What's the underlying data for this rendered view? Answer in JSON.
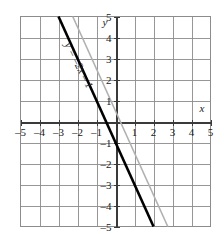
{
  "chart_data": {
    "type": "line",
    "title": "",
    "xlabel": "x",
    "ylabel": "y",
    "xlim": [
      -5,
      5
    ],
    "ylim": [
      -5,
      5
    ],
    "grid": true,
    "grid_step": 1,
    "legend_position": "none",
    "x_ticks": [
      "-5",
      "-4",
      "-3",
      "-2",
      "-1",
      "1",
      "2",
      "3",
      "4",
      "5"
    ],
    "x_tick_values": [
      -5,
      -4,
      -3,
      -2,
      -1,
      1,
      2,
      3,
      4,
      5
    ],
    "y_ticks": [
      "5",
      "4",
      "3",
      "2",
      "1",
      "-1",
      "-2",
      "-3",
      "-4",
      "-5"
    ],
    "y_tick_values": [
      5,
      4,
      3,
      2,
      1,
      -1,
      -2,
      -3,
      -4,
      -5
    ],
    "series": [
      {
        "name": "y = -2x - 1",
        "style": "solid-bold",
        "color": "#000000",
        "slope": -2,
        "intercept": -1,
        "label": "y = –2x – 1",
        "endpoints": [
          [
            -3,
            5
          ],
          [
            2,
            -5
          ]
        ]
      },
      {
        "name": "reference line",
        "style": "solid-light",
        "color": "#b0b0b0",
        "slope": -2,
        "intercept": 0.5,
        "label": "",
        "endpoints": [
          [
            -2.25,
            5
          ],
          [
            2.75,
            -5
          ]
        ]
      }
    ],
    "annotations": [
      {
        "text": "y = –2x – 1",
        "x": -2.1,
        "y": 2.6,
        "rotation": 63
      }
    ]
  },
  "axes": {
    "x_axis_name": "x",
    "y_axis_name": "y",
    "x_name_pos": [
      4.55,
      0.45
    ],
    "y_name_pos": [
      -0.55,
      4.55
    ]
  },
  "colors": {
    "grid": "#8c8c8c",
    "axis": "#3a3a3a",
    "line_primary": "#000000",
    "line_secondary": "#b8b8b8",
    "text": "#1a1a1a",
    "background": "#ffffff"
  }
}
